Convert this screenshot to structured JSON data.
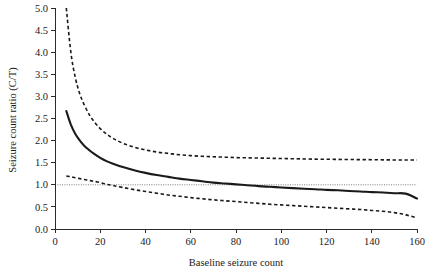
{
  "figure": {
    "background_color": "#ffffff",
    "foreground_color": "#1a1a1a",
    "reference_line_color": "#6d6d6d"
  },
  "chart_data": {
    "type": "line",
    "title": "",
    "subtitle": "",
    "xlabel": "Baseline seizure count",
    "ylabel": "Seizure count ratio (C/T)",
    "xlim": [
      0,
      160
    ],
    "ylim": [
      0.0,
      5.0
    ],
    "xticks": [
      0,
      20,
      40,
      60,
      80,
      100,
      120,
      140,
      160
    ],
    "xtick_labels": [
      "0",
      "20",
      "40",
      "60",
      "80",
      "100",
      "120",
      "140",
      "160"
    ],
    "yticks": [
      0.0,
      0.5,
      1.0,
      1.5,
      2.0,
      2.5,
      3.0,
      3.5,
      4.0,
      4.5,
      5.0
    ],
    "ytick_labels": [
      "0.0",
      "0.5",
      "1.0",
      "1.5",
      "2.0",
      "2.5",
      "3.0",
      "3.5",
      "4.0",
      "4.5",
      "5.0"
    ],
    "grid": false,
    "legend": false,
    "legend_position": "none",
    "annotations": [
      {
        "name": "reference-line-at-one",
        "type": "hline",
        "y": 1.0,
        "style": "dotted",
        "label": ""
      }
    ],
    "x": [
      5,
      7,
      9,
      11,
      13,
      15,
      17,
      20,
      23,
      26,
      30,
      35,
      40,
      45,
      50,
      55,
      60,
      65,
      70,
      75,
      80,
      85,
      90,
      95,
      100,
      105,
      110,
      115,
      120,
      125,
      130,
      135,
      140,
      145,
      150,
      155,
      160
    ],
    "series": [
      {
        "name": "Upper 95% confidence limit",
        "style": "dashed",
        "values": [
          5.0,
          4.0,
          3.42,
          3.05,
          2.8,
          2.6,
          2.45,
          2.27,
          2.14,
          2.04,
          1.94,
          1.85,
          1.79,
          1.74,
          1.71,
          1.68,
          1.66,
          1.645,
          1.635,
          1.625,
          1.615,
          1.61,
          1.605,
          1.6,
          1.595,
          1.59,
          1.585,
          1.58,
          1.578,
          1.575,
          1.572,
          1.57,
          1.568,
          1.565,
          1.562,
          1.56,
          1.56
        ]
      },
      {
        "name": "Estimated seizure count ratio",
        "style": "solid",
        "values": [
          2.67,
          2.36,
          2.15,
          2.0,
          1.88,
          1.79,
          1.71,
          1.61,
          1.53,
          1.47,
          1.4,
          1.33,
          1.27,
          1.22,
          1.18,
          1.14,
          1.11,
          1.08,
          1.05,
          1.03,
          1.01,
          0.99,
          0.97,
          0.955,
          0.94,
          0.925,
          0.91,
          0.9,
          0.885,
          0.875,
          0.86,
          0.85,
          0.835,
          0.825,
          0.81,
          0.8,
          0.69
        ]
      },
      {
        "name": "Lower 95% confidence limit",
        "style": "dashed",
        "values": [
          1.2,
          1.18,
          1.16,
          1.14,
          1.12,
          1.1,
          1.08,
          1.05,
          1.01,
          0.98,
          0.94,
          0.89,
          0.85,
          0.81,
          0.77,
          0.74,
          0.71,
          0.685,
          0.66,
          0.64,
          0.62,
          0.6,
          0.58,
          0.56,
          0.545,
          0.53,
          0.515,
          0.5,
          0.485,
          0.47,
          0.455,
          0.44,
          0.42,
          0.4,
          0.37,
          0.32,
          0.25
        ]
      }
    ]
  }
}
